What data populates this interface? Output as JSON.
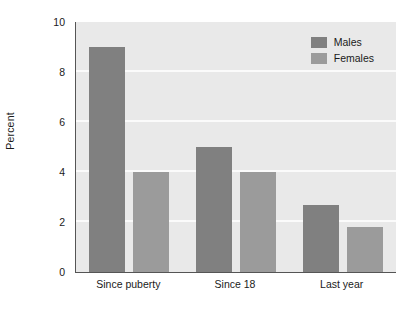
{
  "chart_data": {
    "type": "bar",
    "title": "",
    "xlabel": "",
    "ylabel": "Percent",
    "categories": [
      "Since puberty",
      "Since 18",
      "Last year"
    ],
    "series": [
      {
        "name": "Males",
        "color": "#808080",
        "values": [
          9,
          5,
          2.7
        ]
      },
      {
        "name": "Females",
        "color": "#9b9b9b",
        "values": [
          4,
          4,
          1.8
        ]
      }
    ],
    "ylim": [
      0,
      10
    ],
    "yticks": [
      0,
      2,
      4,
      6,
      8,
      10
    ],
    "ytick_labels": [
      "0",
      "2",
      "4",
      "6",
      "8",
      "10"
    ],
    "grid": "horizontal",
    "legend_position": "top-right",
    "plot_background": "#e9e9e9",
    "gridline_color": "#fbfbfb",
    "axis_color": "#555555"
  },
  "legend": {
    "items": [
      {
        "label": "Males",
        "swatch": "males-swatch"
      },
      {
        "label": "Females",
        "swatch": "females-swatch"
      }
    ]
  }
}
